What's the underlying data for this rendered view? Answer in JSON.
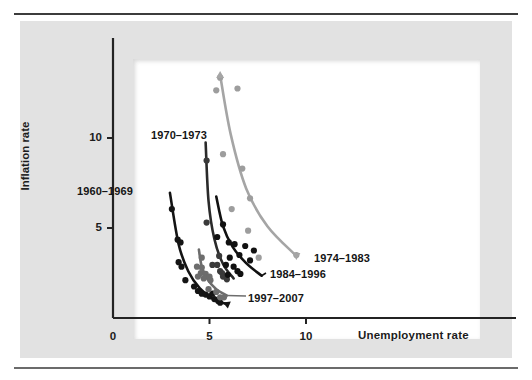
{
  "figure": {
    "background": "#e2e2e2",
    "plot_background": "#ffffff",
    "rule_color": "#3c3c3c"
  },
  "chart_data": {
    "type": "scatter",
    "title": "",
    "subtitle": "",
    "xlabel": "Unemployment rate",
    "ylabel": "Inflation rate",
    "xlim": [
      0,
      11.8
    ],
    "ylim": [
      0,
      14.2
    ],
    "xticks": [
      0,
      5,
      10
    ],
    "xticklabels": [
      "0",
      "5",
      "10"
    ],
    "yticks": [
      5,
      10
    ],
    "yticklabels": [
      "5",
      "10"
    ],
    "grid": false,
    "legend_position": "inline-annotations",
    "series": [
      {
        "name": "1960–1969",
        "label": "1960–1969",
        "color": "#141414",
        "point_color": "#141414",
        "curve_color": "#141414",
        "label_x": 77,
        "label_y": 185,
        "points": [
          {
            "x": 3.05,
            "y": 6.05
          },
          {
            "x": 3.35,
            "y": 4.35
          },
          {
            "x": 3.5,
            "y": 4.2
          },
          {
            "x": 3.4,
            "y": 3.1
          },
          {
            "x": 3.55,
            "y": 2.85
          },
          {
            "x": 3.75,
            "y": 2.1
          },
          {
            "x": 4.2,
            "y": 1.75
          },
          {
            "x": 4.4,
            "y": 1.5
          },
          {
            "x": 4.6,
            "y": 1.35
          },
          {
            "x": 4.8,
            "y": 1.3
          },
          {
            "x": 5.0,
            "y": 1.2
          },
          {
            "x": 5.15,
            "y": 1.35
          },
          {
            "x": 5.25,
            "y": 1.05
          },
          {
            "x": 5.45,
            "y": 0.95
          },
          {
            "x": 5.55,
            "y": 0.85
          }
        ],
        "curve": [
          {
            "x": 2.95,
            "y": 6.95
          },
          {
            "x": 3.4,
            "y": 4.1
          },
          {
            "x": 3.9,
            "y": 2.6
          },
          {
            "x": 4.5,
            "y": 1.65
          },
          {
            "x": 5.2,
            "y": 1.05
          },
          {
            "x": 5.95,
            "y": 0.75
          }
        ]
      },
      {
        "name": "1970–1973",
        "label": "1970–1973",
        "color": "#3a3a3a",
        "point_color": "#3a3a3a",
        "curve_color": "#2a2a2a",
        "label_x": 151,
        "label_y": 129,
        "points": [
          {
            "x": 4.85,
            "y": 8.75
          },
          {
            "x": 4.85,
            "y": 5.3
          },
          {
            "x": 5.5,
            "y": 3.45
          },
          {
            "x": 5.15,
            "y": 2.95
          },
          {
            "x": 5.4,
            "y": 2.95
          },
          {
            "x": 5.55,
            "y": 2.6
          },
          {
            "x": 5.65,
            "y": 2.5
          },
          {
            "x": 5.7,
            "y": 2.3
          },
          {
            "x": 5.9,
            "y": 2.15
          }
        ],
        "curve": [
          {
            "x": 4.8,
            "y": 9.75
          },
          {
            "x": 4.95,
            "y": 6.5
          },
          {
            "x": 5.25,
            "y": 4.4
          },
          {
            "x": 5.7,
            "y": 3.0
          },
          {
            "x": 6.25,
            "y": 2.2
          }
        ]
      },
      {
        "name": "1974–1983",
        "label": "1974–1983",
        "color": "#9d9d9d",
        "point_color": "#9d9d9d",
        "curve_color": "#a5a5a5",
        "label_x": 314,
        "label_y": 252,
        "points": [
          {
            "x": 5.55,
            "y": 13.35
          },
          {
            "x": 5.35,
            "y": 12.65
          },
          {
            "x": 6.45,
            "y": 12.75
          },
          {
            "x": 5.7,
            "y": 9.1
          },
          {
            "x": 6.7,
            "y": 8.3
          },
          {
            "x": 7.1,
            "y": 6.65
          },
          {
            "x": 6.15,
            "y": 6.05
          },
          {
            "x": 7.0,
            "y": 4.85
          },
          {
            "x": 9.5,
            "y": 3.5
          },
          {
            "x": 7.55,
            "y": 3.35
          }
        ],
        "curve": [
          {
            "x": 5.55,
            "y": 13.5
          },
          {
            "x": 6.1,
            "y": 10.2
          },
          {
            "x": 6.9,
            "y": 7.2
          },
          {
            "x": 8.0,
            "y": 5.1
          },
          {
            "x": 9.5,
            "y": 3.45
          }
        ]
      },
      {
        "name": "1984–1996",
        "label": "1984–1996",
        "color": "#111111",
        "point_color": "#111111",
        "curve_color": "#111111",
        "label_x": 270,
        "label_y": 268,
        "points": [
          {
            "x": 5.7,
            "y": 5.2
          },
          {
            "x": 5.4,
            "y": 4.5
          },
          {
            "x": 6.0,
            "y": 4.2
          },
          {
            "x": 6.3,
            "y": 4.1
          },
          {
            "x": 6.85,
            "y": 4.0
          },
          {
            "x": 7.3,
            "y": 3.75
          },
          {
            "x": 6.05,
            "y": 3.35
          },
          {
            "x": 6.55,
            "y": 3.5
          },
          {
            "x": 7.1,
            "y": 3.2
          },
          {
            "x": 5.85,
            "y": 2.95
          },
          {
            "x": 6.25,
            "y": 2.85
          },
          {
            "x": 6.45,
            "y": 2.6
          },
          {
            "x": 6.6,
            "y": 2.45
          },
          {
            "x": 5.95,
            "y": 2.4
          }
        ],
        "curve": [
          {
            "x": 5.35,
            "y": 6.75
          },
          {
            "x": 5.7,
            "y": 5.1
          },
          {
            "x": 6.2,
            "y": 3.95
          },
          {
            "x": 6.9,
            "y": 3.05
          },
          {
            "x": 7.7,
            "y": 2.35
          }
        ]
      },
      {
        "name": "1997–2007",
        "label": "1997–2007",
        "color": "#6d6d6d",
        "point_color": "#6d6d6d",
        "curve_color": "#6d6d6d",
        "label_x": 248,
        "label_y": 292,
        "points": [
          {
            "x": 4.6,
            "y": 3.35
          },
          {
            "x": 4.35,
            "y": 2.85
          },
          {
            "x": 4.6,
            "y": 2.8
          },
          {
            "x": 4.55,
            "y": 2.5
          },
          {
            "x": 4.8,
            "y": 2.45
          },
          {
            "x": 4.4,
            "y": 2.3
          },
          {
            "x": 4.7,
            "y": 2.2
          },
          {
            "x": 5.0,
            "y": 2.3
          },
          {
            "x": 5.05,
            "y": 2.1
          },
          {
            "x": 4.95,
            "y": 1.6
          },
          {
            "x": 5.35,
            "y": 1.45
          },
          {
            "x": 5.55,
            "y": 1.15
          },
          {
            "x": 5.75,
            "y": 1.15
          }
        ],
        "curve": [
          {
            "x": 4.45,
            "y": 3.8
          },
          {
            "x": 4.6,
            "y": 2.85
          },
          {
            "x": 4.9,
            "y": 2.15
          },
          {
            "x": 5.35,
            "y": 1.6
          },
          {
            "x": 5.9,
            "y": 1.25
          }
        ]
      }
    ]
  }
}
